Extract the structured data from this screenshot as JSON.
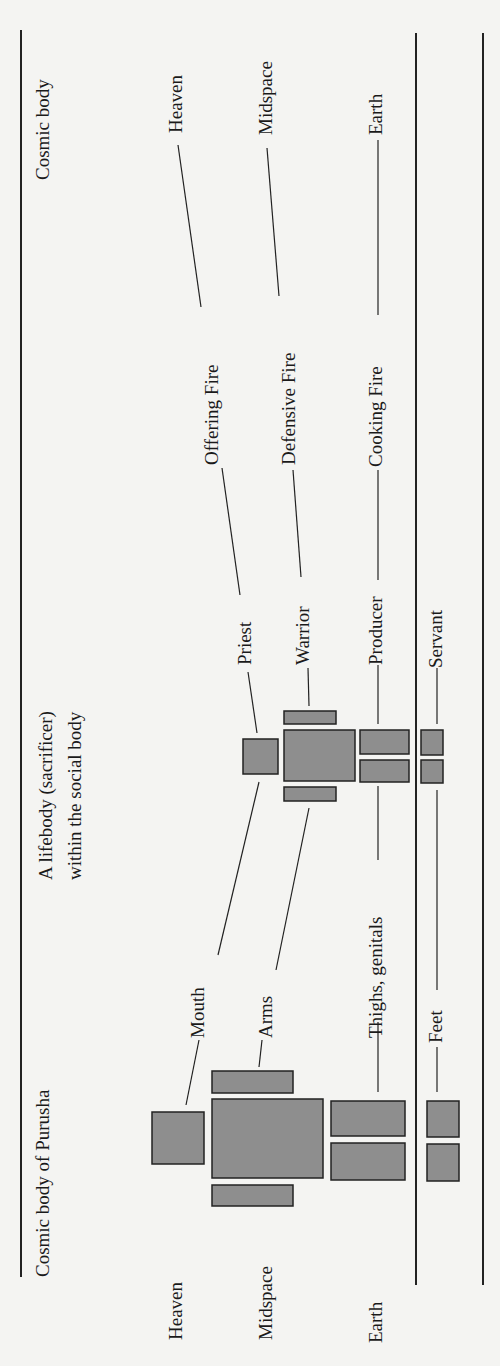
{
  "figure": {
    "orientation": "rotated 90 degrees counter-clockwise",
    "headers": {
      "left_column": "Cosmic body of Purusha",
      "middle_column_line1": "A lifebody (sacrificer)",
      "middle_column_line2": "within the social body",
      "right_column": "Cosmic body"
    },
    "cosmic_levels_left": [
      "Heaven",
      "Midspace",
      "Earth"
    ],
    "purusha_parts": [
      "Mouth",
      "Arms",
      "Thighs, genitals",
      "Feet"
    ],
    "social_roles": [
      "Priest",
      "Warrior",
      "Producer",
      "Servant"
    ],
    "fires": [
      "Offering Fire",
      "Defensive Fire",
      "Cooking Fire"
    ],
    "cosmic_levels_right": [
      "Heaven",
      "Midspace",
      "Earth"
    ],
    "mappings": [
      {
        "part": "Mouth",
        "role": "Priest",
        "fire": "Offering Fire",
        "cosmos": "Heaven"
      },
      {
        "part": "Arms",
        "role": "Warrior",
        "fire": "Defensive Fire",
        "cosmos": "Midspace"
      },
      {
        "part": "Thighs, genitals",
        "role": "Producer",
        "fire": "Cooking Fire",
        "cosmos": "Earth"
      },
      {
        "part": "Feet",
        "role": "Servant",
        "fire": null,
        "cosmos": null
      }
    ],
    "colors": {
      "box_fill": "#8e8e8e",
      "ink": "#222222",
      "paper": "#f4f4f2"
    }
  }
}
